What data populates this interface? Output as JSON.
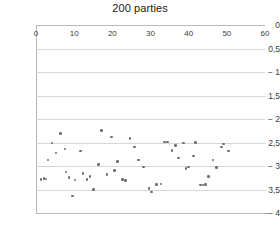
{
  "chart_data": {
    "type": "scatter",
    "title": "200 parties",
    "xlabel": "",
    "ylabel": "",
    "xlim": [
      0,
      60
    ],
    "ylim": [
      -4,
      0
    ],
    "grid": true,
    "legend": null,
    "decimal_separator": ",",
    "marker_color": "#6e6e6e",
    "gridline_color": "#d6d6d6",
    "axis_color": "#9a9a9a",
    "x_ticks": [
      0,
      10,
      20,
      30,
      40,
      50,
      60
    ],
    "x_tick_labels": [
      "0",
      "10",
      "20",
      "30",
      "40",
      "50",
      "60"
    ],
    "y_ticks": [
      0,
      -0.5,
      -1,
      -1.5,
      -2,
      -2.5,
      -3,
      -3.5,
      -4
    ],
    "y_tick_labels": [
      "0",
      "0,5",
      "1",
      "1,5",
      "2",
      "2,5",
      "3",
      "3,5",
      "4"
    ],
    "y_tick_prefix": "−",
    "points": [
      [
        1.3,
        -3.29
      ],
      [
        2.1,
        -3.27
      ],
      [
        2.6,
        -3.28
      ],
      [
        3.1,
        -2.87
      ],
      [
        4.2,
        -2.51
      ],
      [
        5.2,
        -2.72
      ],
      [
        6.4,
        -2.31
      ],
      [
        7.6,
        -2.64
      ],
      [
        7.9,
        -3.13
      ],
      [
        8.6,
        -3.25
      ],
      [
        9.6,
        -3.64
      ],
      [
        10.2,
        -3.3
      ],
      [
        11.6,
        -2.68
      ],
      [
        12.3,
        -3.16
      ],
      [
        13.4,
        -3.29
      ],
      [
        14.2,
        -3.22
      ],
      [
        15.1,
        -3.5
      ],
      [
        16.3,
        -2.97
      ],
      [
        17.2,
        -2.25
      ],
      [
        18.6,
        -3.18
      ],
      [
        19.8,
        -2.38
      ],
      [
        20.6,
        -3.1
      ],
      [
        21.4,
        -2.9
      ],
      [
        22.6,
        -3.29
      ],
      [
        23.4,
        -3.31
      ],
      [
        24.6,
        -2.42
      ],
      [
        25.8,
        -2.6
      ],
      [
        26.9,
        -2.87
      ],
      [
        28.2,
        -3.02
      ],
      [
        29.6,
        -3.48
      ],
      [
        30.3,
        -3.55
      ],
      [
        31.5,
        -3.39
      ],
      [
        32.8,
        -3.38
      ],
      [
        33.6,
        -2.49
      ],
      [
        34.4,
        -2.49
      ],
      [
        35.6,
        -2.67
      ],
      [
        36.5,
        -2.56
      ],
      [
        37.4,
        -2.83
      ],
      [
        38.6,
        -2.51
      ],
      [
        39.3,
        -3.05
      ],
      [
        39.9,
        -3.02
      ],
      [
        41.2,
        -2.79
      ],
      [
        41.8,
        -2.5
      ],
      [
        43.1,
        -3.4
      ],
      [
        43.8,
        -3.4
      ],
      [
        44.4,
        -3.39
      ],
      [
        45.2,
        -3.22
      ],
      [
        46.4,
        -2.87
      ],
      [
        47.3,
        -3.03
      ],
      [
        48.6,
        -2.6
      ],
      [
        49.2,
        -2.53
      ],
      [
        50.4,
        -2.68
      ]
    ]
  }
}
